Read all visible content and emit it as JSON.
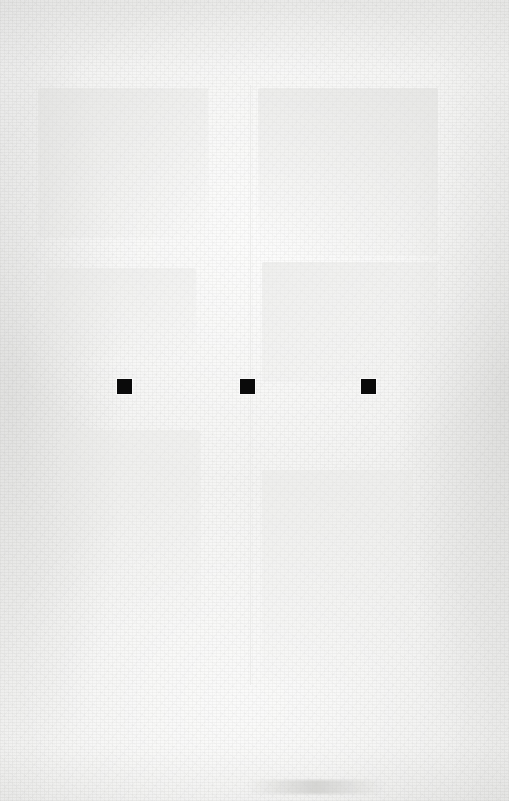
{
  "document": {
    "kind": "scanned-page",
    "condition": "faded",
    "width_px": 509,
    "height_px": 801,
    "background_color": "#f3f3f2",
    "visible_text": ""
  },
  "marks": {
    "label": "black-squares",
    "count": 3,
    "color": "#0a0a0a",
    "size_px": 15,
    "top_px": 379,
    "items": [
      {
        "name": "mark-1",
        "x": 117,
        "y": 379,
        "w": 15,
        "h": 15
      },
      {
        "name": "mark-2",
        "x": 240,
        "y": 379,
        "w": 15,
        "h": 15
      },
      {
        "name": "mark-3",
        "x": 361,
        "y": 379,
        "w": 15,
        "h": 15
      }
    ]
  },
  "ghost_traces": {
    "note": "near-invisible residual print showing through the faded scan",
    "column_divider": {
      "x": 250,
      "y": 85,
      "w": 1,
      "h": 600,
      "color": "#e4e4e2"
    },
    "blocks": [
      {
        "name": "ghost-block-upper-left",
        "x": 38,
        "y": 88,
        "w": 170,
        "h": 150,
        "color": "#ededeb"
      },
      {
        "name": "ghost-block-upper-right",
        "x": 258,
        "y": 88,
        "w": 180,
        "h": 168,
        "color": "#ededeb"
      },
      {
        "name": "ghost-block-mid-left",
        "x": 46,
        "y": 268,
        "w": 150,
        "h": 90,
        "color": "#efefed"
      },
      {
        "name": "ghost-block-mid-right",
        "x": 262,
        "y": 262,
        "w": 176,
        "h": 120,
        "color": "#efefed"
      },
      {
        "name": "ghost-block-lower-left",
        "x": 60,
        "y": 430,
        "w": 140,
        "h": 190,
        "color": "#f0f0ee"
      },
      {
        "name": "ghost-block-lower-right",
        "x": 262,
        "y": 470,
        "w": 150,
        "h": 210,
        "color": "#f0f0ee"
      }
    ],
    "bottom_smudge": {
      "name": "bottom-smudge",
      "x": 248,
      "y": 780,
      "w": 136,
      "h": 14,
      "color": "#d9d9d7"
    }
  }
}
